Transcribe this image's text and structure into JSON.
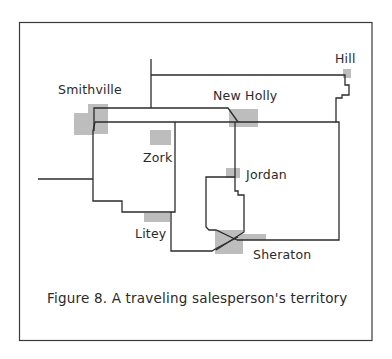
{
  "figure": {
    "caption": "Figure 8.  A traveling salesperson's territory"
  },
  "towns": [
    {
      "name": "Hill"
    },
    {
      "name": "Smithville"
    },
    {
      "name": "New Holly"
    },
    {
      "name": "Zork"
    },
    {
      "name": "Jordan"
    },
    {
      "name": "Litey"
    },
    {
      "name": "Sheraton"
    }
  ],
  "colors": {
    "road": "#2b2b2b",
    "town_marker": "#bdbdbd",
    "frame": "#3a3a3a",
    "text": "#2a2a2a"
  }
}
